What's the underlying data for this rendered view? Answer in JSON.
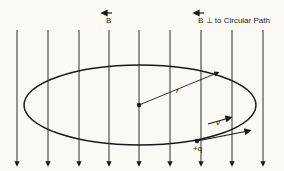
{
  "labels": {
    "b_field": "B",
    "b_perp": "B ⊥ to Circular Path",
    "radius": "r",
    "velocity": "v",
    "charge": "+q"
  },
  "field_lines_x": [
    17,
    48,
    79,
    109,
    139,
    170,
    201,
    232,
    263
  ],
  "colors": {
    "ink": "#1a1a1a",
    "background": "#fbf9f3"
  }
}
